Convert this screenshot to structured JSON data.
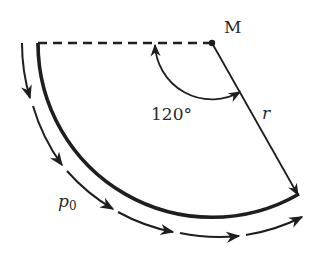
{
  "diagram": {
    "center_label": "M",
    "angle_label": "120°",
    "radius_label": "r",
    "pressure_label": "p",
    "pressure_subscript": "0",
    "angle_degrees": 120,
    "colors": {
      "stroke": "#1e1e1e",
      "background": "#ffffff"
    }
  }
}
